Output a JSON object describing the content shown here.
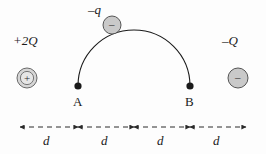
{
  "figure": {
    "background_color": "#fdfdfd",
    "line_color": "#1a1a1a",
    "charge_fill": "#c9c9c9",
    "charge_stroke": "#555555",
    "dim_color": "#2a2a2a"
  },
  "charges": [
    {
      "id": "left-charge",
      "label": "+2Q",
      "sign": "+",
      "type": "positive",
      "style": "ringed",
      "cx": 27,
      "cy": 78,
      "r": 10
    },
    {
      "id": "right-charge",
      "label": "–Q",
      "sign": "–",
      "type": "negative",
      "style": "filled",
      "cx": 238,
      "cy": 78,
      "r": 10
    },
    {
      "id": "moving-charge",
      "label": "–q",
      "sign": "–",
      "type": "negative",
      "style": "filled",
      "cx": 112,
      "cy": 25,
      "r": 9
    }
  ],
  "points": [
    {
      "id": "point-a",
      "label": "A",
      "x": 78,
      "y": 86
    },
    {
      "id": "point-b",
      "label": "B",
      "x": 190,
      "y": 86
    }
  ],
  "path": {
    "name": "semicircular-trajectory",
    "from": "A",
    "to": "B",
    "direction": "counterclockwise-over-top",
    "arrow_at": "B"
  },
  "dimensions": {
    "axis_y": 127,
    "labels": [
      "d",
      "d",
      "d",
      "d"
    ],
    "ticks": [
      20,
      78,
      134,
      190,
      246
    ],
    "segments": [
      {
        "label": "d",
        "x1": 20,
        "x2": 78
      },
      {
        "label": "d",
        "x1": 78,
        "x2": 134
      },
      {
        "label": "d",
        "x1": 134,
        "x2": 190
      },
      {
        "label": "d",
        "x1": 190,
        "x2": 246
      }
    ]
  }
}
